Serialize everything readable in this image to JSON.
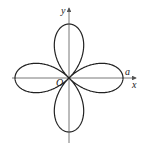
{
  "figure": {
    "curve": {
      "type": "polar-rose",
      "equation": "r = a cos 2θ",
      "petals": 4,
      "orientation": "along-axes",
      "stroke_color": "#222222"
    },
    "axes": {
      "x_label": "x",
      "y_label": "y",
      "origin_label": "O",
      "axis_color": "#555555"
    },
    "annotations": {
      "a_label": "a"
    }
  }
}
